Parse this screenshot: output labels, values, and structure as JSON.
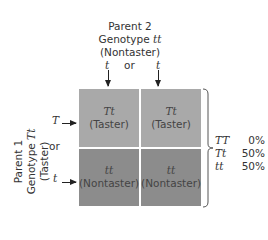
{
  "parent2": {
    "title": "Parent 2",
    "genotype_label": "Genotype",
    "genotype": "tt",
    "phenotype": "(Nontaster)",
    "alleles": [
      "t",
      "t"
    ],
    "or": "or"
  },
  "parent1": {
    "title": "Parent 1",
    "genotype_label": "Genotype",
    "genotype": "Tt",
    "phenotype": "(Taster)",
    "alleles": [
      "T",
      "t"
    ],
    "or": "or"
  },
  "grid": {
    "cells": [
      {
        "genotype": "Tt",
        "phenotype": "(Taster)"
      },
      {
        "genotype": "Tt",
        "phenotype": "(Taster)"
      },
      {
        "genotype": "tt",
        "phenotype": "(Nontaster)"
      },
      {
        "genotype": "tt",
        "phenotype": "(Nontaster)"
      }
    ],
    "colors": {
      "taster": "#a9a9a9",
      "nontaster": "#8c8c8c"
    }
  },
  "results": [
    {
      "genotype": "TT",
      "percent": "0%"
    },
    {
      "genotype": "Tt",
      "percent": "50%"
    },
    {
      "genotype": "tt",
      "percent": "50%"
    }
  ]
}
